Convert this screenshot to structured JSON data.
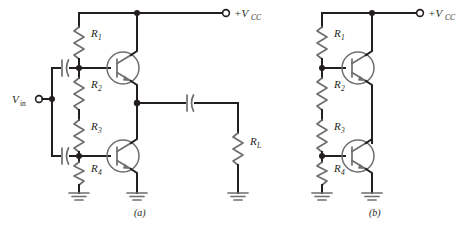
{
  "figure": {
    "type": "electronic-schematic",
    "captions": [
      {
        "id": "caption-a",
        "text": "(a)"
      },
      {
        "id": "caption-b",
        "text": "(b)"
      }
    ],
    "colors": {
      "wire": "#231f20",
      "component": "#6d6e71",
      "background": "#ffffff",
      "text": "#231f20"
    }
  },
  "circuit_a": {
    "caption": "(a)",
    "supply_label": "+V",
    "supply_sub": "CC",
    "input_label": "V",
    "input_sub": "in",
    "resistors": [
      {
        "name": "R1",
        "label": "R",
        "sub": "1"
      },
      {
        "name": "R2",
        "label": "R",
        "sub": "2"
      },
      {
        "name": "R3",
        "label": "R",
        "sub": "3"
      },
      {
        "name": "R4",
        "label": "R",
        "sub": "4"
      },
      {
        "name": "RL",
        "label": "R",
        "sub": "L"
      }
    ],
    "transistors": [
      {
        "name": "Q1",
        "type": "npn"
      },
      {
        "name": "Q2",
        "type": "npn"
      }
    ],
    "capacitors": [
      {
        "name": "C-input-upper",
        "type": "polarized"
      },
      {
        "name": "C-input-lower",
        "type": "polarized"
      },
      {
        "name": "C-output",
        "type": "polarized"
      }
    ],
    "grounds": [
      {
        "name": "ground-r4"
      },
      {
        "name": "ground-q2-emitter"
      },
      {
        "name": "ground-rl"
      }
    ]
  },
  "circuit_b": {
    "caption": "(b)",
    "supply_label": "+V",
    "supply_sub": "CC",
    "resistors": [
      {
        "name": "R1",
        "label": "R",
        "sub": "1"
      },
      {
        "name": "R2",
        "label": "R",
        "sub": "2"
      },
      {
        "name": "R3",
        "label": "R",
        "sub": "3"
      },
      {
        "name": "R4",
        "label": "R",
        "sub": "4"
      }
    ],
    "transistors": [
      {
        "name": "Q1",
        "type": "npn"
      },
      {
        "name": "Q2",
        "type": "npn"
      }
    ],
    "grounds": [
      {
        "name": "ground-r4"
      },
      {
        "name": "ground-q2-emitter"
      }
    ]
  }
}
